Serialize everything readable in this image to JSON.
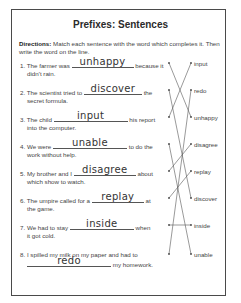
{
  "worksheet": {
    "title": "Prefixes: Sentences",
    "directions_label": "Directions:",
    "directions_text": " Match each sentence with the word which completes it. Then write the word on the line.",
    "sentences": [
      {
        "num": "1.",
        "before": "The farmer was",
        "answer": "unhappy",
        "after": "because it",
        "cont": "didn't rain."
      },
      {
        "num": "2.",
        "before": "The scientist tried to",
        "answer": "discover",
        "after": "the",
        "cont": "secret formula."
      },
      {
        "num": "3.",
        "before": "The child",
        "answer": "input",
        "after": "his report",
        "cont": "into the computer."
      },
      {
        "num": "4.",
        "before": "We were",
        "answer": "unable",
        "after": "to do the",
        "cont": "work without help."
      },
      {
        "num": "5.",
        "before": "My brother and I",
        "answer": "disagree",
        "after": "about",
        "cont": "which show to watch."
      },
      {
        "num": "6.",
        "before": "The umpire called for a",
        "answer": "replay",
        "after": "at",
        "cont": "the game."
      },
      {
        "num": "7.",
        "before": "We had to stay",
        "answer": "inside",
        "after": "when",
        "cont": "it got cold."
      },
      {
        "num": "8.",
        "before": "I spilled my milk on my paper and had to",
        "answer": "redo",
        "after": "my homework.",
        "cont": ""
      }
    ],
    "word_bank": [
      "input",
      "redo",
      "unhappy",
      "disagree",
      "replay",
      "discover",
      "inside",
      "unable"
    ],
    "matches": [
      {
        "sentence": 1,
        "word": "unhappy"
      },
      {
        "sentence": 2,
        "word": "discover"
      },
      {
        "sentence": 3,
        "word": "input"
      },
      {
        "sentence": 4,
        "word": "unable"
      },
      {
        "sentence": 5,
        "word": "disagree"
      },
      {
        "sentence": 6,
        "word": "replay"
      },
      {
        "sentence": 7,
        "word": "inside"
      },
      {
        "sentence": 8,
        "word": "redo"
      }
    ]
  }
}
